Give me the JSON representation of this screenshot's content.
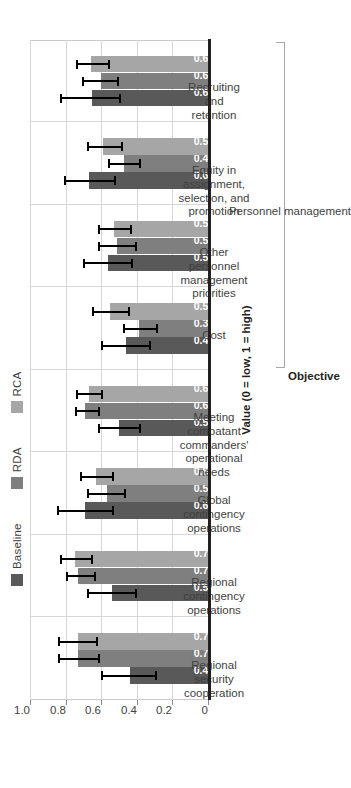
{
  "chart_data": {
    "type": "bar",
    "title": "",
    "orientation": "horizontal-rotated",
    "xlabel": "Objective",
    "ylabel": "Value (0 = low, 1 = high)",
    "ylim": [
      0,
      1.0
    ],
    "ytick_labels": [
      "0",
      "0.2",
      "0.4",
      "0.6",
      "0.8",
      "1.0"
    ],
    "ytick_values": [
      0,
      0.2,
      0.4,
      0.6,
      0.8,
      1.0
    ],
    "grid": true,
    "legend_position": "top",
    "categories": [
      "Regional security cooperation",
      "Regional contingency operations",
      "Global contingency operations",
      "Meeting combatant commanders' operational needs",
      "Cost",
      "Other personnel management priorities",
      "Equity in assignment, selection, and promotion",
      "Recruiting and retention"
    ],
    "category_label_lines": [
      [
        "Regional",
        "security",
        "cooperation"
      ],
      [
        "Regional",
        "contingency",
        "operations"
      ],
      [
        "Global",
        "contingency",
        "operations"
      ],
      [
        "Meeting",
        "combatant",
        "commanders'",
        "operational",
        "needs"
      ],
      [
        "Cost"
      ],
      [
        "Other",
        "personnel",
        "management",
        "priorities"
      ],
      [
        "Equity in",
        "assignment,",
        "selection, and",
        "promotion"
      ],
      [
        "Recruiting",
        "and",
        "retention"
      ]
    ],
    "series": [
      {
        "name": "Baseline",
        "color": "#595959",
        "values": [
          0.44,
          0.54,
          0.69,
          0.5,
          0.46,
          0.56,
          0.67,
          0.65
        ],
        "err_low": [
          0.3,
          0.41,
          0.54,
          0.39,
          0.33,
          0.43,
          0.53,
          0.5
        ],
        "err_high": [
          0.6,
          0.68,
          0.85,
          0.62,
          0.6,
          0.7,
          0.81,
          0.83
        ]
      },
      {
        "name": "RDA",
        "color": "#7f7f7f",
        "values": [
          0.73,
          0.73,
          0.57,
          0.69,
          0.39,
          0.51,
          0.47,
          0.6
        ],
        "err_low": [
          0.62,
          0.64,
          0.47,
          0.62,
          0.29,
          0.41,
          0.39,
          0.51
        ],
        "err_high": [
          0.84,
          0.8,
          0.68,
          0.75,
          0.48,
          0.62,
          0.56,
          0.71
        ]
      },
      {
        "name": "RCA",
        "color": "#a6a6a6",
        "values": [
          0.73,
          0.75,
          0.63,
          0.67,
          0.55,
          0.53,
          0.59,
          0.66
        ],
        "err_low": [
          0.63,
          0.66,
          0.54,
          0.6,
          0.45,
          0.44,
          0.49,
          0.56
        ],
        "err_high": [
          0.84,
          0.83,
          0.72,
          0.74,
          0.65,
          0.62,
          0.68,
          0.74
        ]
      }
    ],
    "annotations": [
      {
        "label": "Personnel management",
        "type": "bracket",
        "spans_categories": [
          4,
          5,
          6,
          7
        ]
      }
    ]
  },
  "legend": {
    "items": [
      {
        "label": "Baseline",
        "color": "#595959",
        "swatch": "legend-swatch-baseline"
      },
      {
        "label": "RDA",
        "color": "#7f7f7f",
        "swatch": "legend-swatch-rda"
      },
      {
        "label": "RCA",
        "color": "#a6a6a6",
        "swatch": "legend-swatch-rca"
      }
    ]
  },
  "axes": {
    "value_axis_title": "Value (0 = low, 1 = high)",
    "category_axis_title": "Objective"
  }
}
